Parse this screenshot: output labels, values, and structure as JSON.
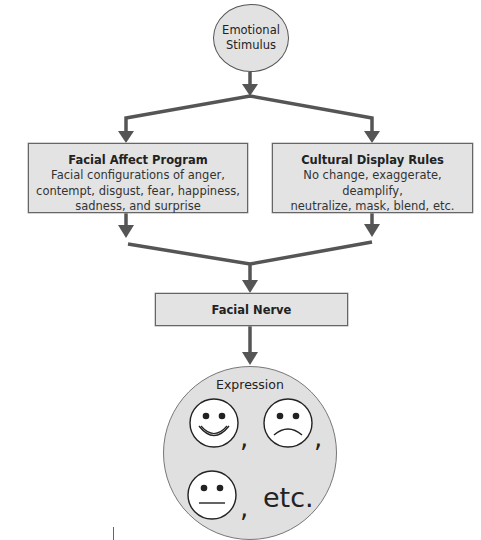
{
  "diagram": {
    "start": {
      "label_line1": "Emotional",
      "label_line2": "Stimulus"
    },
    "left_box": {
      "title": "Facial Affect Program",
      "desc_line1": "Facial configurations of anger,",
      "desc_line2": "contempt, disgust, fear, happiness,",
      "desc_line3": "sadness, and surprise"
    },
    "right_box": {
      "title": "Cultural Display Rules",
      "desc_line1": "No change, exaggerate, deamplify,",
      "desc_line2": "neutralize, mask, blend, etc."
    },
    "merge_box": {
      "title": "Facial Nerve"
    },
    "output": {
      "title": "Expression",
      "faces": [
        "happy-face",
        "sad-face",
        "neutral-face"
      ],
      "separator": ",",
      "etc_label": "etc."
    }
  },
  "colors": {
    "node_fill": "#e2e2e2",
    "arrow": "#555555",
    "background": "#ffffff"
  }
}
